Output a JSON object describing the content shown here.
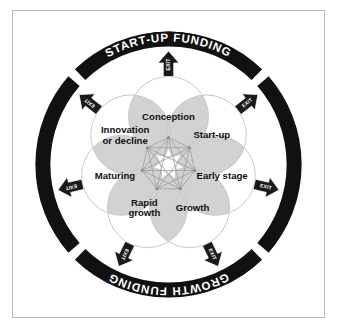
{
  "diagram": {
    "colors": {
      "ring_fill": "#111111",
      "ring_text": "#ffffff",
      "circle_stroke": "#c9c9c9",
      "overlap_fill": "#d2d2d2",
      "mesh_stroke": "#9a9a9a",
      "arrow_fill": "#1a1a1a",
      "frame_border": "#b9b9b9",
      "label_text": "#111111",
      "background": "#ffffff"
    },
    "outer_ring": {
      "segment_count": 4,
      "gap_angles_deg": [
        45,
        135,
        225,
        315
      ],
      "segments": [
        {
          "label": "START-UP  FUNDING",
          "position": "top",
          "start_deg": 225,
          "end_deg": 315
        },
        {
          "label": "OPERATIONAL FUNDING",
          "position": "right",
          "start_deg": 315,
          "end_deg": 45
        },
        {
          "label": "GROWTH  FUNDING",
          "position": "bottom",
          "start_deg": 45,
          "end_deg": 135
        },
        {
          "label": "OPERATIONAL FUNDING",
          "position": "left",
          "start_deg": 135,
          "end_deg": 225
        }
      ]
    },
    "stages": [
      {
        "name": "Conception",
        "lines": [
          "Conception"
        ],
        "angle_deg": -90,
        "order": 1
      },
      {
        "name": "Start-up",
        "lines": [
          "Start-up"
        ],
        "angle_deg": -38,
        "order": 2
      },
      {
        "name": "Early stage",
        "lines": [
          "Early stage"
        ],
        "angle_deg": 13,
        "order": 3
      },
      {
        "name": "Growth",
        "lines": [
          "Growth"
        ],
        "angle_deg": 64,
        "order": 4
      },
      {
        "name": "Rapid growth",
        "lines": [
          "Rapid",
          "growth"
        ],
        "angle_deg": 116,
        "order": 5
      },
      {
        "name": "Maturing",
        "lines": [
          "Maturing"
        ],
        "angle_deg": 167,
        "order": 6
      },
      {
        "name": "Innovation or decline",
        "lines": [
          "Innovation",
          "or decline"
        ],
        "angle_deg": 218,
        "order": 7
      }
    ],
    "exits": [
      {
        "label": "EXIT",
        "direction": "up",
        "angle_deg": -90,
        "for_stage": "Conception"
      },
      {
        "label": "EXIT",
        "direction": "up-right",
        "angle_deg": -38,
        "for_stage": "Start-up"
      },
      {
        "label": "EXIT",
        "direction": "right",
        "angle_deg": 13,
        "for_stage": "Early stage"
      },
      {
        "label": "EXIT",
        "direction": "down-right",
        "angle_deg": 64,
        "for_stage": "Growth"
      },
      {
        "label": "EXIT",
        "direction": "down",
        "angle_deg": 116,
        "for_stage": "Rapid growth"
      },
      {
        "label": "EXIT",
        "direction": "down-left",
        "angle_deg": 167,
        "for_stage": "Maturing"
      },
      {
        "label": "EXIT",
        "direction": "up-left",
        "angle_deg": 218,
        "for_stage": "Innovation or decline"
      }
    ],
    "center_network": {
      "node_count": 7,
      "type": "complete-graph",
      "description": "K7 mesh interconnecting all seven stages"
    }
  }
}
